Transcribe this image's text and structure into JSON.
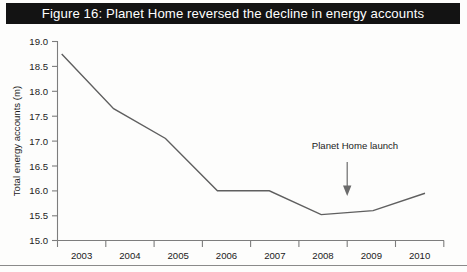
{
  "figure": {
    "title": "Figure 16: Planet Home reversed the decline in energy accounts",
    "title_band_color": "#131313",
    "title_text_color": "#ffffff",
    "line_color": "#5f5f5f",
    "axis_color": "#7d7d7d"
  },
  "chart_data": {
    "type": "line",
    "title": "Figure 16: Planet Home reversed the decline in energy accounts",
    "xlabel": "",
    "ylabel": "Total energy accounts (m)",
    "categories": [
      "2003",
      "2004",
      "2005",
      "2006",
      "2007",
      "2008",
      "2009",
      "2010"
    ],
    "x": [
      2003,
      2004,
      2005,
      2006,
      2007,
      2008,
      2009,
      2010
    ],
    "values": [
      18.75,
      17.65,
      17.05,
      16.0,
      16.0,
      15.52,
      15.6,
      15.95
    ],
    "series": [
      {
        "name": "Total energy accounts",
        "values": [
          18.75,
          17.65,
          17.05,
          16.0,
          16.0,
          15.52,
          15.6,
          15.95
        ]
      }
    ],
    "ylim": [
      15.0,
      19.0
    ],
    "y_ticks": [
      "15.0",
      "15.5",
      "16.0",
      "16.5",
      "17.0",
      "17.5",
      "18.0",
      "18.5",
      "19.0"
    ],
    "y_tick_values": [
      15.0,
      15.5,
      16.0,
      16.5,
      17.0,
      17.5,
      18.0,
      18.5,
      19.0
    ],
    "x_tick_labels": [
      "2003",
      "2004",
      "2005",
      "2006",
      "2007",
      "2008",
      "2009",
      "2010"
    ],
    "grid": false,
    "legend": null,
    "annotations": [
      {
        "text": "Planet Home launch",
        "x": 2008.5,
        "points_to_year": 2008.5,
        "arrow": "down"
      }
    ]
  },
  "axis": {
    "y_label": "Total energy accounts (m)",
    "y_ticks": [
      "19.0",
      "18.5",
      "18.0",
      "17.5",
      "17.0",
      "16.5",
      "16.0",
      "15.5",
      "15.0"
    ],
    "x_ticks": [
      "2003",
      "2004",
      "2005",
      "2006",
      "2007",
      "2008",
      "2009",
      "2010"
    ]
  },
  "annotation": {
    "label": "Planet Home launch"
  }
}
